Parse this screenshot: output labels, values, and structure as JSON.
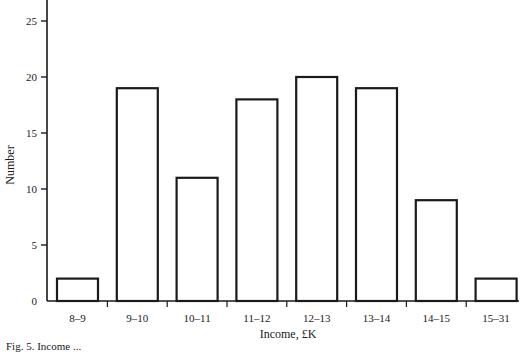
{
  "chart_data": {
    "type": "bar",
    "title": "",
    "xlabel": "Income, £K",
    "ylabel": "Number",
    "categories": [
      "8–9",
      "9–10",
      "10–11",
      "11–12",
      "12–13",
      "13–14",
      "14–15",
      "15–31"
    ],
    "values": [
      2,
      19,
      11,
      18,
      20,
      19,
      9,
      2
    ],
    "ylim": [
      0,
      26
    ],
    "yticks": [
      0,
      5,
      10,
      15,
      20,
      25
    ],
    "grid": false,
    "legend": null,
    "bar_style": {
      "fill": "#ffffff",
      "stroke": "#1a1a1a"
    }
  },
  "caption": "Fig. 5. Income ..."
}
